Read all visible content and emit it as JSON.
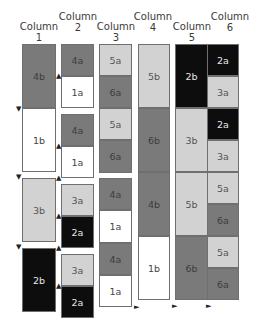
{
  "headers": [
    {
      "line1": "Column",
      "line2": "1"
    },
    {
      "line1": "Column",
      "line2": "2"
    },
    {
      "line1": "Column",
      "line2": "3"
    },
    {
      "line1": "Column",
      "line2": "4"
    },
    {
      "line1": "Column",
      "line2": "5"
    },
    {
      "line1": "Column",
      "line2": "6"
    }
  ],
  "colors": {
    "dark_gray": "#7a7a7a",
    "white": "#ffffff",
    "light_gray": "#d2d2d2",
    "black": "#0d0d0d"
  },
  "columns": {
    "col1": [
      "4b",
      "1b",
      "3b",
      "2b"
    ],
    "col2": [
      "4a",
      "1a",
      "4a",
      "1a",
      "3a",
      "2a",
      "3a",
      "2a"
    ],
    "col3": [
      "5a",
      "6a",
      "5a",
      "6a",
      "4a",
      "1a",
      "4a",
      "1a"
    ],
    "col4": [
      "5b",
      "6b",
      "4b",
      "1b"
    ],
    "col5": [
      "2b",
      "3b",
      "5b",
      "6b"
    ],
    "col6": [
      "2a",
      "3a",
      "2a",
      "3a",
      "5a",
      "6a",
      "5a",
      "6a"
    ]
  },
  "arrows": {
    "down": "▼",
    "up": "▲",
    "right": "►"
  }
}
